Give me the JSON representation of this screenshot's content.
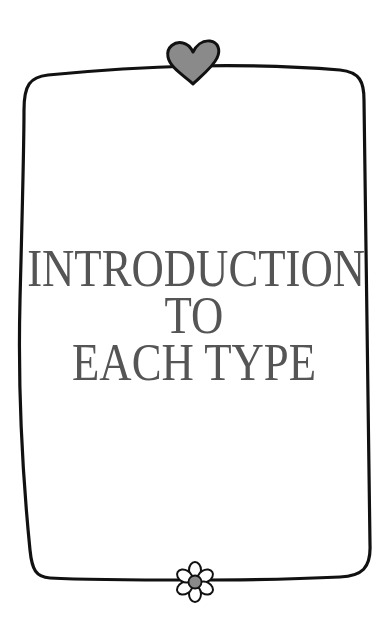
{
  "page": {
    "title_lines": [
      "INTRODUCTION",
      "TO",
      "EACH TYPE"
    ],
    "colors": {
      "background": "#ffffff",
      "frame_stroke": "#111111",
      "text": "#555555",
      "heart_fill": "#8a8a8a",
      "flower_center": "#8a8a8a",
      "flower_petals": "#ffffff"
    },
    "decorations": {
      "top": "heart-icon",
      "bottom": "flower-icon"
    }
  }
}
